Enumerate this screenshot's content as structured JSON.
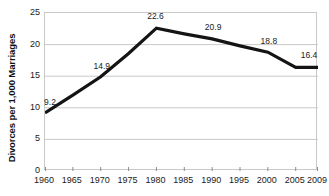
{
  "chart_data": {
    "type": "line",
    "title": "",
    "subtitle": "",
    "xlabel": "",
    "ylabel": "Divorces per 1,000 Marriages",
    "x": [
      1960,
      1965,
      1970,
      1975,
      1980,
      1985,
      1990,
      1995,
      2000,
      2005,
      2009
    ],
    "categories": [
      "1960",
      "1965",
      "1970",
      "1975",
      "1980",
      "1985",
      "1990",
      "1995",
      "2000",
      "2005",
      "2009"
    ],
    "values": [
      9.2,
      12.0,
      14.9,
      18.6,
      22.6,
      21.7,
      20.9,
      19.8,
      18.8,
      16.4,
      16.4
    ],
    "xlim": [
      1960,
      2009
    ],
    "ylim": [
      0,
      25
    ],
    "yticks": [
      0,
      5,
      10,
      15,
      20,
      25
    ],
    "ytick_labels": [
      "0",
      "5",
      "10",
      "15",
      "20",
      "25"
    ],
    "xtick_labels": [
      "1960",
      "1965",
      "1970",
      "1975",
      "1980",
      "1985",
      "1990",
      "1995",
      "2000",
      "2005",
      "2009"
    ],
    "grid": "horizontal",
    "legend": "none",
    "series_color": "#141414",
    "gridline_color": "#c9c9c9",
    "background_color": "#ffffff",
    "annotations": [
      {
        "label": "9.2",
        "x": 1960,
        "y": 9.2,
        "dx": 6,
        "dy": -9
      },
      {
        "label": "14.9",
        "x": 1970,
        "y": 14.9,
        "dx": 2,
        "dy": -9
      },
      {
        "label": "22.6",
        "x": 1980,
        "y": 22.6,
        "dx": 0,
        "dy": -10
      },
      {
        "label": "20.9",
        "x": 1990,
        "y": 20.9,
        "dx": 2,
        "dy": -10
      },
      {
        "label": "18.8",
        "x": 2000,
        "y": 18.8,
        "dx": 2,
        "dy": -9
      },
      {
        "label": "16.4",
        "x": 2009,
        "y": 16.4,
        "dx": -8,
        "dy": -10
      }
    ]
  }
}
